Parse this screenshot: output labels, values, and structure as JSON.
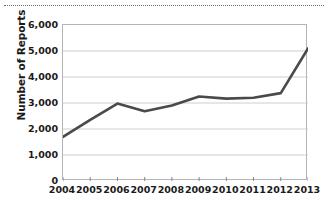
{
  "figure": {
    "top_rule": "dotted-separator"
  },
  "chart_data": {
    "type": "line",
    "title": "",
    "xlabel": "",
    "ylabel": "Number of Reports",
    "categories": [
      "2004",
      "2005",
      "2006",
      "2007",
      "2008",
      "2009",
      "2010",
      "2011",
      "2012",
      "2013"
    ],
    "values": [
      1700,
      2350,
      2980,
      2680,
      2900,
      3250,
      3170,
      3200,
      3380,
      5100
    ],
    "series": [
      {
        "name": "Number of Reports",
        "values": [
          1700,
          2350,
          2980,
          2680,
          2900,
          3250,
          3170,
          3200,
          3380,
          5100
        ]
      }
    ],
    "ylim": [
      0,
      6000
    ],
    "y_ticks": [
      0,
      1000,
      2000,
      3000,
      4000,
      5000,
      6000
    ],
    "y_tick_labels": [
      "0",
      "1,000",
      "2,000",
      "3,000",
      "4,000",
      "5,000",
      "6,000"
    ],
    "x_tick_labels": [
      "2004",
      "2005",
      "2006",
      "2007",
      "2008",
      "2009",
      "2010",
      "2011",
      "2012",
      "2013"
    ],
    "grid": "horizontal",
    "legend": "none",
    "line_color": "#4a4a4a",
    "grid_color": "#c8c8c8",
    "axis_color": "#b4b4b4"
  }
}
